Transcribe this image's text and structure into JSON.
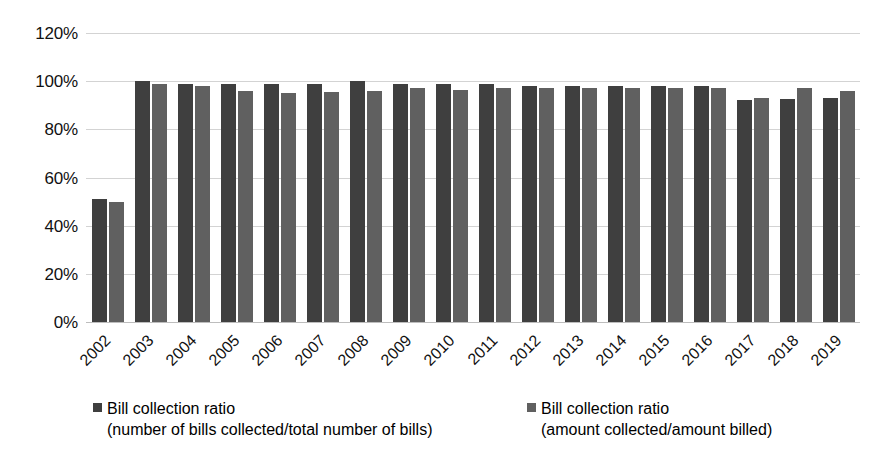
{
  "chart_data": {
    "type": "bar",
    "title": "",
    "xlabel": "",
    "ylabel": "",
    "ylim": [
      0,
      120
    ],
    "ytick_labels": [
      "120%",
      "100%",
      "80%",
      "60%",
      "40%",
      "20%",
      "0%"
    ],
    "ytick_values": [
      120,
      100,
      80,
      60,
      40,
      20,
      0
    ],
    "grid": true,
    "legend_position": "bottom",
    "categories": [
      "2002",
      "2003",
      "2004",
      "2005",
      "2006",
      "2007",
      "2008",
      "2009",
      "2010",
      "2011",
      "2012",
      "2013",
      "2014",
      "2015",
      "2016",
      "2017",
      "2018",
      "2019"
    ],
    "series": [
      {
        "name": "Bill collection ratio (number of bills collected/total number of bills)",
        "color": "#3f3f3f",
        "values": [
          51,
          100,
          99,
          99,
          99,
          99,
          100,
          99,
          99,
          99,
          98,
          98,
          98,
          98,
          98,
          92,
          92.5,
          93
        ]
      },
      {
        "name": "Bill collection ratio (amount collected/amount billed)",
        "color": "#606060",
        "values": [
          50,
          99,
          98,
          96,
          95,
          95.5,
          96,
          97,
          96.5,
          97,
          97,
          97,
          97,
          97,
          97,
          93,
          97,
          96
        ]
      }
    ]
  },
  "legend": {
    "entries": [
      {
        "line1": "Bill collection ratio",
        "line2": "(number of bills collected/total number of bills)",
        "color": "#3f3f3f"
      },
      {
        "line1": "Bill collection ratio",
        "line2": "(amount collected/amount billed)",
        "color": "#606060"
      }
    ]
  },
  "colors": {
    "series0": "#3f3f3f",
    "series1": "#606060",
    "gridline": "#d3d3d3",
    "background": "#ffffff",
    "text": "#111111"
  }
}
